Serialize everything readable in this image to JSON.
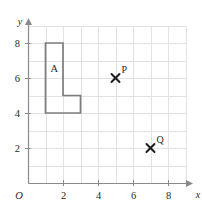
{
  "chart_data": {
    "type": "scatter",
    "title": "",
    "xlabel": "x",
    "ylabel": "y",
    "xlim": [
      0,
      9.2
    ],
    "ylim": [
      0,
      9.2
    ],
    "grid": true,
    "grid_spacing": 1,
    "legend": "none",
    "origin_label": "O",
    "xticks": [
      2,
      4,
      6,
      8
    ],
    "xtick_labels": [
      "2",
      "4",
      "6",
      "8"
    ],
    "yticks": [
      2,
      4,
      6,
      8
    ],
    "ytick_labels": [
      "8",
      "6",
      "4",
      "2"
    ],
    "shapes": [
      {
        "name": "A",
        "label": "A",
        "label_x": 1.5,
        "label_y": 6.6,
        "vertices": [
          [
            1,
            8
          ],
          [
            2,
            8
          ],
          [
            2,
            5
          ],
          [
            3,
            5
          ],
          [
            3,
            4
          ],
          [
            1,
            4
          ]
        ],
        "closed": true,
        "stroke": "#7d7d7d",
        "fill": "none"
      }
    ],
    "points": [
      {
        "name": "P",
        "label": "P",
        "x": 5,
        "y": 6,
        "marker": "cross"
      },
      {
        "name": "Q",
        "label": "Q",
        "x": 7,
        "y": 2,
        "marker": "cross"
      }
    ]
  },
  "figure": {
    "axis_color": "#8a8a8a",
    "grid_color": "#e2e2e2",
    "shape_color": "#7d7d7d",
    "marker_color": "#1b1b1b",
    "background": "#ffffff"
  },
  "labels": {
    "y_axis": "y",
    "x_axis": "x",
    "origin": "O",
    "shape_a": "A",
    "point_p": "P",
    "point_q": "Q",
    "x_2": "2",
    "x_4": "4",
    "x_6": "6",
    "x_8": "8",
    "y_2": "2",
    "y_4": "4",
    "y_6": "6",
    "y_8": "8"
  }
}
